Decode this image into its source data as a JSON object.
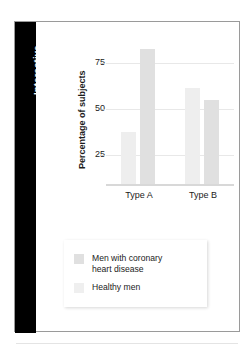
{
  "panel": {
    "tab_label": "Interactive"
  },
  "chart_data": {
    "type": "bar",
    "title": "",
    "xlabel": "",
    "ylabel": "Percentage of subjects",
    "categories": [
      "Type A",
      "Type B"
    ],
    "yticks": [
      25,
      50,
      75
    ],
    "ylim": [
      0,
      80
    ],
    "grid": true,
    "legend_position": "below-plot",
    "series": [
      {
        "name": "Men with coronary heart disease",
        "color": "#e0e0e0",
        "values": [
          72,
          45
        ]
      },
      {
        "name": "Healthy men",
        "color": "#efefef",
        "values": [
          28,
          51
        ]
      }
    ]
  },
  "legend": {
    "items": [
      {
        "label": "Men with coronary\nheart disease",
        "swatch": "chd"
      },
      {
        "label": "Healthy men",
        "swatch": "healthy"
      }
    ]
  }
}
